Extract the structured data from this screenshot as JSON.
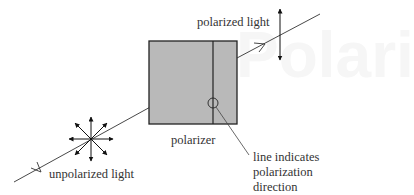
{
  "background_watermark": "Polari",
  "labels": {
    "polarized_light": "polarized light",
    "polarizer": "polarizer",
    "unpolarized_light": "unpolarized light",
    "annotation_line1": "line indicates",
    "annotation_line2": "polarization",
    "annotation_line3": "direction"
  },
  "colors": {
    "polarizer_fill": "#b9b9b9",
    "stroke": "#222222",
    "text": "#333333"
  }
}
